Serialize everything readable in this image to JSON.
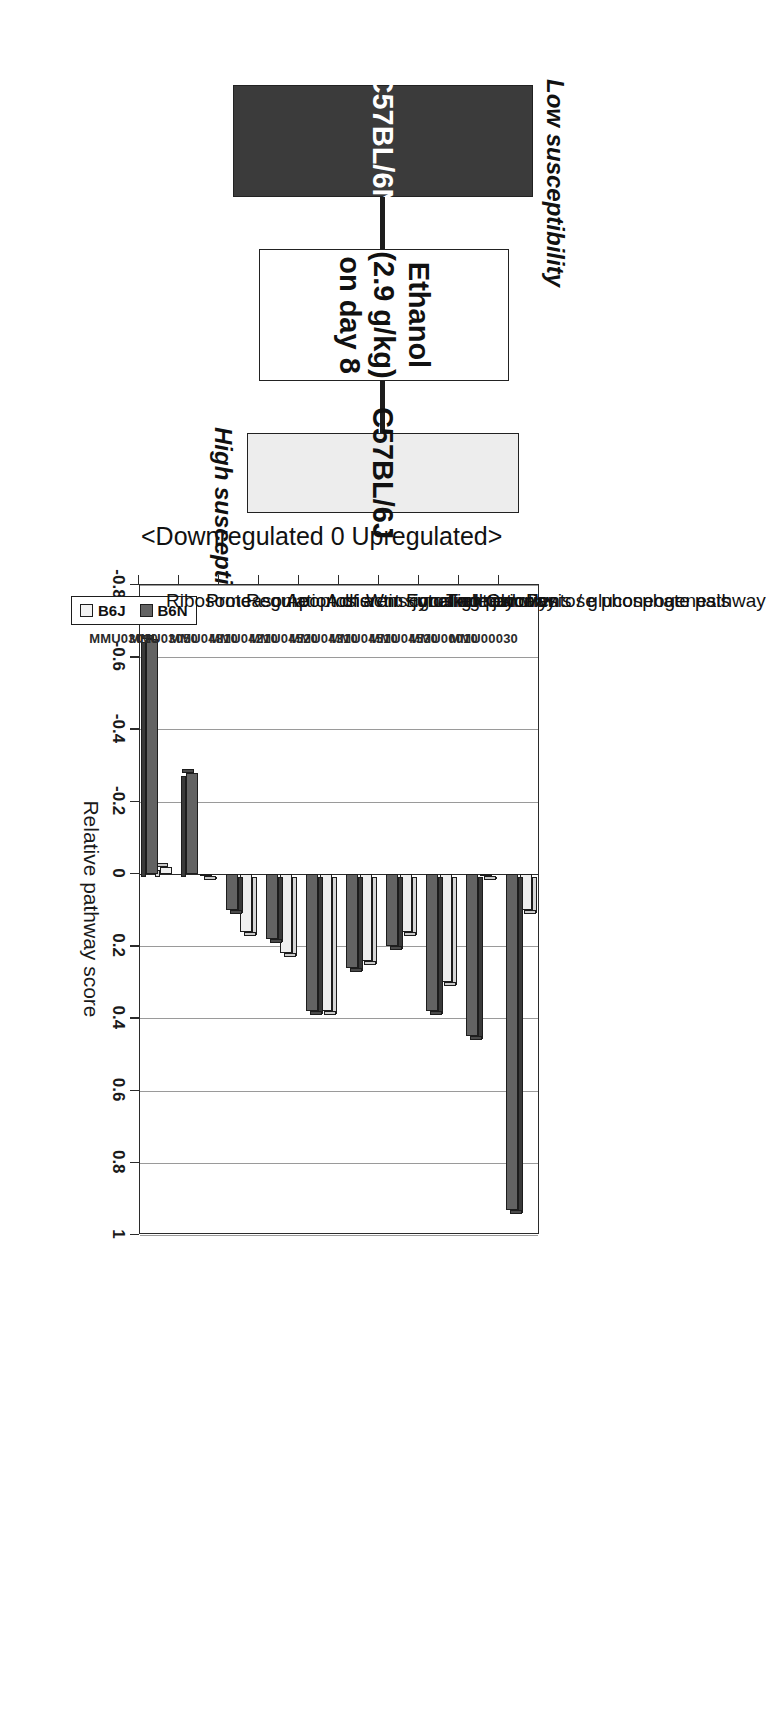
{
  "figure": {
    "direction_annotation": "<Downregulated   0   Upregulated>",
    "axis_title": "Relative pathway score",
    "legend": {
      "items": [
        {
          "label": "B6J"
        },
        {
          "label": "B6N"
        }
      ]
    }
  },
  "flow": {
    "top_caption": "Low susceptibility",
    "bottom_caption": "High susceptibility",
    "strain_low": "C57BL/6N",
    "strain_high": "C57BL/6J",
    "treatment_line1": "Ethanol",
    "treatment_line2": "(2.9 g/kg)",
    "treatment_line3": "on day 8"
  },
  "chart_data": {
    "type": "bar",
    "title": "",
    "xlabel": "Relative pathway score",
    "ylabel": "",
    "orientation": "horizontal",
    "xlim": [
      -0.8,
      1
    ],
    "grid": true,
    "legend_position": "bottom-left",
    "ticks": [
      "-0.8",
      "-0.6",
      "-0.4",
      "-0.2",
      "0",
      "0.2",
      "0.4",
      "0.6",
      "0.8",
      "1"
    ],
    "tick_values": [
      -0.8,
      -0.6,
      -0.4,
      -0.2,
      0,
      0.2,
      0.4,
      0.6,
      0.8,
      1
    ],
    "categories": [
      "Pentose phosphate pathway",
      "Glycolysis / gluconeogenesis",
      "Tight junction",
      "Focal adhesion",
      "Wnt signaling pathway",
      "Adherens junction",
      "Apoptosis",
      "Regulation of actin cytoskeleton",
      "Proteasome",
      "Ribosome"
    ],
    "category_ids": [
      "MMU00030",
      "MMU00010",
      "MMU04530",
      "MMU04510",
      "MMU04310",
      "MMU04520",
      "MMU04210",
      "MMU04810",
      "MMU03050",
      "MMU03010"
    ],
    "series": [
      {
        "name": "B6J",
        "color": "#efefef",
        "values": [
          0.1,
          0.0,
          0.3,
          0.16,
          0.24,
          0.38,
          0.22,
          0.16,
          0.0,
          -0.02
        ]
      },
      {
        "name": "B6N",
        "color": "#636363",
        "values": [
          0.93,
          0.45,
          0.38,
          0.2,
          0.26,
          0.38,
          0.18,
          0.1,
          -0.28,
          -0.65
        ]
      }
    ]
  }
}
